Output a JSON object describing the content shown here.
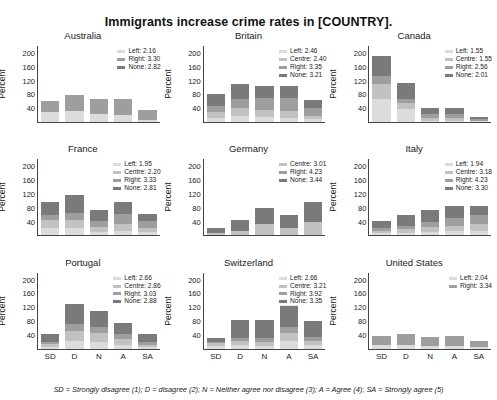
{
  "chart_data": {
    "type": "bar",
    "title": "Immigrants increase crime rates in [COUNTRY].",
    "subtitle": "",
    "xlabel": "",
    "ylabel": "Percent",
    "categories": [
      "SD",
      "D",
      "N",
      "A",
      "SA"
    ],
    "yticks": [
      "200",
      "160",
      "120",
      "80",
      "40"
    ],
    "ylim": [
      0,
      220
    ],
    "grid": false,
    "legend_position": "top-right inside panel",
    "stack_order": [
      "Left",
      "Centre",
      "Right",
      "None"
    ],
    "colors": {
      "Left": "#dcdcdc",
      "Centre": "#c2c2c2",
      "Right": "#9e9e9e",
      "None": "#7a7a7a"
    },
    "footnote": "SD = Strongly disagree (1); D = disagree (2); N = Neither agree nor disagree (3); A = Agree (4); SA = Strongly agree (5)",
    "panels": [
      {
        "name": "Australia",
        "legend": [
          {
            "label": "Left: 2.16",
            "series": "Left"
          },
          {
            "label": "Right: 3.30",
            "series": "Right"
          },
          {
            "label": "None: 2.82",
            "series": "None"
          }
        ],
        "series": [
          {
            "name": "Left",
            "values": [
              28,
              33,
              22,
              21,
              6
            ]
          },
          {
            "name": "Right",
            "values": [
              32,
              44,
              44,
              46,
              29
            ]
          }
        ]
      },
      {
        "name": "Britain",
        "legend": [
          {
            "label": "Left: 2.46",
            "series": "Left"
          },
          {
            "label": "Centre: 2.40",
            "series": "Centre"
          },
          {
            "label": "Right: 3.35",
            "series": "Right"
          },
          {
            "label": "None: 3.21",
            "series": "None"
          }
        ],
        "series": [
          {
            "name": "Left",
            "values": [
              12,
              18,
              14,
              13,
              8
            ]
          },
          {
            "name": "Centre",
            "values": [
              16,
              22,
              21,
              19,
              10
            ]
          },
          {
            "name": "Right",
            "values": [
              17,
              28,
              36,
              38,
              24
            ]
          },
          {
            "name": "None",
            "values": [
              35,
              42,
              34,
              34,
              22
            ]
          }
        ]
      },
      {
        "name": "Canada",
        "legend": [
          {
            "label": "Left: 1.55",
            "series": "Left"
          },
          {
            "label": "Centre: 1.55",
            "series": "Centre"
          },
          {
            "label": "Right: 2.56",
            "series": "Right"
          },
          {
            "label": "None: 2.01",
            "series": "None"
          }
        ],
        "series": [
          {
            "name": "Left",
            "values": [
              66,
              37,
              4,
              4,
              2
            ]
          },
          {
            "name": "Centre",
            "values": [
              44,
              18,
              8,
              7,
              2
            ]
          },
          {
            "name": "Right",
            "values": [
              22,
              12,
              12,
              12,
              4
            ]
          },
          {
            "name": "None",
            "values": [
              58,
              46,
              17,
              18,
              8
            ]
          }
        ]
      },
      {
        "name": "France",
        "legend": [
          {
            "label": "Left: 1.95",
            "series": "Left"
          },
          {
            "label": "Centre: 2.20",
            "series": "Centre"
          },
          {
            "label": "Right: 3.33",
            "series": "Right"
          },
          {
            "label": "None: 2.81",
            "series": "None"
          }
        ],
        "series": [
          {
            "name": "Left",
            "values": [
              22,
              20,
              10,
              14,
              10
            ]
          },
          {
            "name": "Centre",
            "values": [
              22,
              24,
              14,
              18,
              10
            ]
          },
          {
            "name": "Right",
            "values": [
              14,
              22,
              18,
              30,
              22
            ]
          },
          {
            "name": "None",
            "values": [
              40,
              50,
              30,
              34,
              20
            ]
          }
        ]
      },
      {
        "name": "Germany",
        "legend": [
          {
            "label": "Centre: 3.01",
            "series": "Centre"
          },
          {
            "label": "Right: 4.23",
            "series": "Right"
          },
          {
            "label": "None: 3.44",
            "series": "None"
          }
        ],
        "series": [
          {
            "name": "Centre",
            "values": [
              6,
              12,
              34,
              22,
              38
            ]
          },
          {
            "name": "None",
            "values": [
              16,
              32,
              44,
              36,
              58
            ]
          }
        ]
      },
      {
        "name": "Italy",
        "legend": [
          {
            "label": "Left: 1.94",
            "series": "Left"
          },
          {
            "label": "Centre: 3.18",
            "series": "Centre"
          },
          {
            "label": "Right: 4.23",
            "series": "Right"
          },
          {
            "label": "None: 3.30",
            "series": "None"
          }
        ],
        "series": [
          {
            "name": "Left",
            "values": [
              6,
              8,
              10,
              12,
              14
            ]
          },
          {
            "name": "Centre",
            "values": [
              8,
              10,
              14,
              16,
              18
            ]
          },
          {
            "name": "Right",
            "values": [
              6,
              10,
              16,
              22,
              26
            ]
          },
          {
            "name": "None",
            "values": [
              22,
              30,
              34,
              34,
              26
            ]
          }
        ]
      },
      {
        "name": "Portugal",
        "legend": [
          {
            "label": "Left: 2.66",
            "series": "Left"
          },
          {
            "label": "Centre: 2.86",
            "series": "Centre"
          },
          {
            "label": "Right: 3.03",
            "series": "Right"
          },
          {
            "label": "None: 2.88",
            "series": "None"
          }
        ],
        "series": [
          {
            "name": "Left",
            "values": [
              6,
              22,
              20,
              12,
              6
            ]
          },
          {
            "name": "Centre",
            "values": [
              8,
              28,
              24,
              16,
              6
            ]
          },
          {
            "name": "Right",
            "values": [
              6,
              22,
              20,
              14,
              6
            ]
          },
          {
            "name": "None",
            "values": [
              24,
              58,
              46,
              32,
              26
            ]
          }
        ]
      },
      {
        "name": "Switzerland",
        "legend": [
          {
            "label": "Left: 2.66",
            "series": "Left"
          },
          {
            "label": "Centre: 3.21",
            "series": "Centre"
          },
          {
            "label": "Right: 3.92",
            "series": "Right"
          },
          {
            "label": "None: 3.35",
            "series": "None"
          }
        ],
        "series": [
          {
            "name": "Left",
            "values": [
              8,
              10,
              8,
              22,
              10
            ]
          },
          {
            "name": "Centre",
            "values": [
              8,
              12,
              12,
              22,
              12
            ]
          },
          {
            "name": "Right",
            "values": [
              4,
              10,
              12,
              20,
              12
            ]
          },
          {
            "name": "None",
            "values": [
              12,
              50,
              52,
              62,
              46
            ]
          }
        ]
      },
      {
        "name": "United States",
        "legend": [
          {
            "label": "Left: 2.04",
            "series": "Left"
          },
          {
            "label": "Right: 3.34",
            "series": "Right"
          }
        ],
        "series": [
          {
            "name": "Left",
            "values": [
              10,
              12,
              8,
              8,
              4
            ]
          },
          {
            "name": "Right",
            "values": [
              28,
              30,
              26,
              30,
              18
            ]
          }
        ]
      }
    ]
  }
}
